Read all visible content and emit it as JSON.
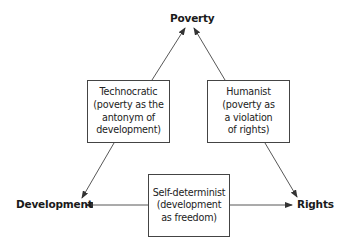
{
  "nodes": {
    "poverty": "Poverty",
    "development": "Development",
    "rights": "Rights"
  },
  "boxes": {
    "technocratic": {
      "lines": [
        "Technocratic",
        "(poverty as the",
        "antonym of",
        "development)"
      ]
    },
    "humanist": {
      "lines": [
        "Humanist",
        "(poverty as",
        "a violation",
        "of rights)"
      ]
    },
    "self_determinist": {
      "lines": [
        "Self-determinist",
        "(development",
        "as freedom)"
      ]
    }
  },
  "edges": [
    {
      "from": "technocratic",
      "to": "poverty"
    },
    {
      "from": "humanist",
      "to": "poverty"
    },
    {
      "from": "technocratic",
      "to": "development"
    },
    {
      "from": "humanist",
      "to": "rights"
    },
    {
      "from": "self_determinist",
      "to": "development"
    },
    {
      "from": "self_determinist",
      "to": "rights"
    }
  ],
  "colors": {
    "line": "#444444",
    "text": "#1a1a1a"
  }
}
